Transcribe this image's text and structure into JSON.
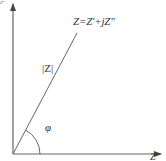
{
  "diagram": {
    "colors": {
      "background": "#ffffff",
      "stroke": "#555555",
      "text": "#333333"
    },
    "axes": {
      "x_label": "Z′",
      "y_label": "Z″"
    },
    "labels": {
      "equation": "Z=Z′+jZ″",
      "magnitude": "|Z|",
      "angle": "φ"
    },
    "geometry": {
      "origin": [
        13,
        154
      ],
      "x_axis_end": [
        162,
        154
      ],
      "y_axis_end": [
        13,
        2
      ],
      "vector_end": [
        77,
        33
      ],
      "arc_radius": 27
    }
  }
}
